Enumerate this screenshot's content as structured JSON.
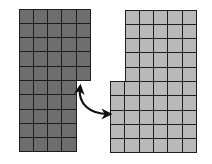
{
  "diagram": {
    "colors": {
      "left_fill": "#6e6e6e",
      "right_fill": "#b9b9b9",
      "border": "#1e1e1e",
      "arrow": "#111111",
      "background": "#ffffff"
    },
    "cell_size": 14.3,
    "left_shape": {
      "origin": [
        19,
        9
      ],
      "parts": [
        {
          "cols": 5,
          "rows": 5,
          "offset_col": 0,
          "offset_row": 0
        },
        {
          "cols": 4,
          "rows": 5,
          "offset_col": 0,
          "offset_row": 5
        }
      ]
    },
    "right_shape": {
      "origin": [
        125,
        10
      ],
      "parts": [
        {
          "cols": 5,
          "rows": 5,
          "offset_col": 0,
          "offset_row": 0
        },
        {
          "cols": 6,
          "rows": 5,
          "offset_col": -1,
          "offset_row": 5
        }
      ]
    },
    "arrow": {
      "type": "double-headed-curved",
      "start": [
        80,
        88
      ],
      "end": [
        108,
        114
      ]
    }
  }
}
